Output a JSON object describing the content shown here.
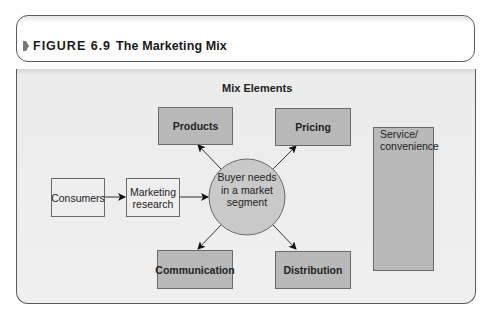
{
  "figure": {
    "label": "FIGURE 6.9",
    "title": "The Marketing Mix",
    "marker_icon": "bullet-arrow-icon"
  },
  "diagram": {
    "section_title": "Mix Elements",
    "mix_elements": {
      "products": "Products",
      "pricing": "Pricing",
      "communication": "Communication",
      "distribution": "Distribution"
    },
    "flow": {
      "consumers": "Consumers",
      "research_line1": "Marketing",
      "research_line2": "research",
      "center_line1": "Buyer needs",
      "center_line2": "in a market",
      "center_line3": "segment"
    },
    "service_line1": "Service/",
    "service_line2": "convenience"
  },
  "colors": {
    "mix_fill": "#b9b9b9",
    "circle_fill": "#c9c9c9",
    "panel_bg": "#efefef",
    "stroke": "#6a6a6a"
  }
}
